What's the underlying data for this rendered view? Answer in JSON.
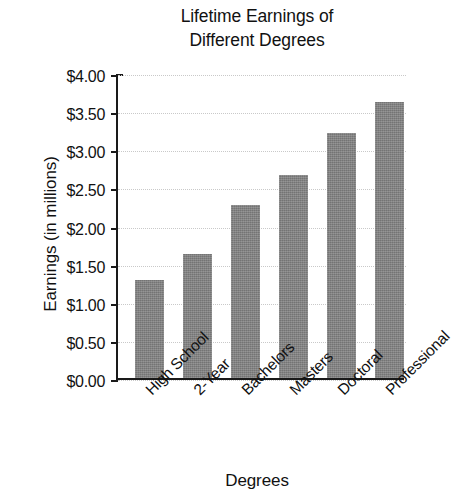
{
  "chart_data": {
    "type": "bar",
    "title": "Lifetime Earnings of\nDifferent Degrees",
    "title_line1": "Lifetime Earnings of",
    "title_line2": "Different Degrees",
    "xlabel": "Degrees",
    "ylabel": "Earnings (in millions)",
    "categories": [
      "High School",
      "2-Year",
      "Bachelors",
      "Masters",
      "Doctoral",
      "Professional"
    ],
    "values": [
      1.28,
      1.62,
      2.27,
      2.66,
      3.21,
      3.62
    ],
    "ylim": [
      0,
      4
    ],
    "ytick_values": [
      0,
      0.5,
      1,
      1.5,
      2,
      2.5,
      3,
      3.5,
      4
    ],
    "ytick_labels": [
      "$0.00",
      "$0.50",
      "$1.00",
      "$1.50",
      "$2.00",
      "$2.50",
      "$3.00",
      "$3.50",
      "$4.00"
    ],
    "grid": true,
    "legend": null,
    "bar_color": "#808080",
    "axis_color": "#1a1a1a",
    "grid_color": "#c9c9c9",
    "background_color": "#ffffff"
  }
}
